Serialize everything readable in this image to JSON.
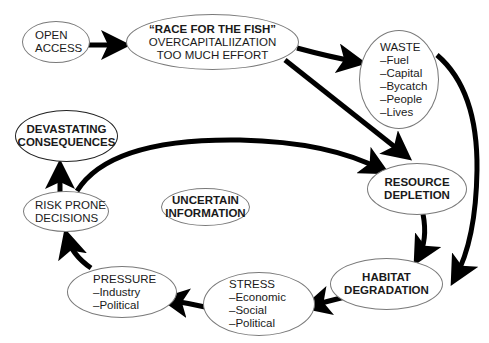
{
  "diagram": {
    "nodes": {
      "open_access": {
        "lines": [
          "OPEN",
          "ACCESS"
        ]
      },
      "race": {
        "lines": [
          "“RACE FOR THE FISH”",
          "OVERCAPITALIIZATION",
          "TOO MUCH EFFORT"
        ]
      },
      "waste": {
        "lines": [
          "WASTE",
          "–Fuel",
          "–Capital",
          "–Bycatch",
          "–People",
          "–Lives"
        ]
      },
      "devastating": {
        "lines": [
          "DEVASTATING",
          "CONSEQUENCES"
        ]
      },
      "resource_depletion": {
        "lines": [
          "RESOURCE",
          "DEPLETION"
        ]
      },
      "uncertain": {
        "lines": [
          "UNCERTAIN",
          "INFORMATION"
        ]
      },
      "risk": {
        "lines": [
          "RISK PRONE",
          "DECISIONS"
        ]
      },
      "habitat": {
        "lines": [
          "HABITAT",
          "DEGRADATION"
        ]
      },
      "pressure": {
        "lines": [
          "PRESSURE",
          "–Industry",
          "–Political"
        ]
      },
      "stress": {
        "lines": [
          "STRESS",
          "–Economic",
          "–Social",
          "–Political"
        ]
      }
    },
    "edges": [
      {
        "from": "open_access",
        "to": "race"
      },
      {
        "from": "race",
        "to": "waste"
      },
      {
        "from": "race",
        "to": "resource_depletion"
      },
      {
        "from": "waste",
        "to": "habitat"
      },
      {
        "from": "resource_depletion",
        "to": "habitat"
      },
      {
        "from": "habitat",
        "to": "stress"
      },
      {
        "from": "stress",
        "to": "pressure"
      },
      {
        "from": "pressure",
        "to": "risk"
      },
      {
        "from": "risk",
        "to": "devastating"
      },
      {
        "from": "risk",
        "to": "resource_depletion"
      }
    ],
    "colors": {
      "stroke": "#000000",
      "border": "#7a7a7a",
      "text": "#1a1a1a",
      "background": "#ffffff"
    }
  }
}
